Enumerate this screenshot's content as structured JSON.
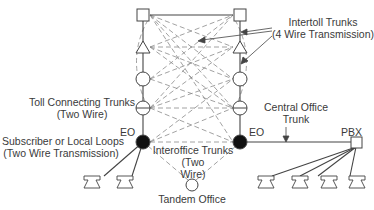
{
  "diagram": {
    "labels": {
      "intertoll": {
        "line1": "Intertoll Trunks",
        "line2": "(4 Wire Transmission)"
      },
      "toll_connecting": {
        "line1": "Toll Connecting Trunks",
        "line2": "(Two Wire)"
      },
      "subscriber": {
        "line1": "Subscriber or Local Loops",
        "line2": "(Two Wire Transmission)"
      },
      "eo_left": "EO",
      "eo_right": "EO",
      "interoffice": {
        "line1": "Interoffice Trunks",
        "line2": "(Two",
        "line3": "Wire)"
      },
      "tandem": "Tandem Office",
      "central_office_trunk": {
        "line1": "Central Office",
        "line2": "Trunk"
      },
      "pbx": "PBX"
    },
    "colors": {
      "line": "#444444",
      "dash": "#8a8a8a",
      "node_fill": "#ffffff",
      "eo_fill": "#111111"
    },
    "hierarchy_nodes": [
      "square",
      "triangle",
      "circle",
      "split-circle",
      "filled-circle (EO)"
    ]
  }
}
